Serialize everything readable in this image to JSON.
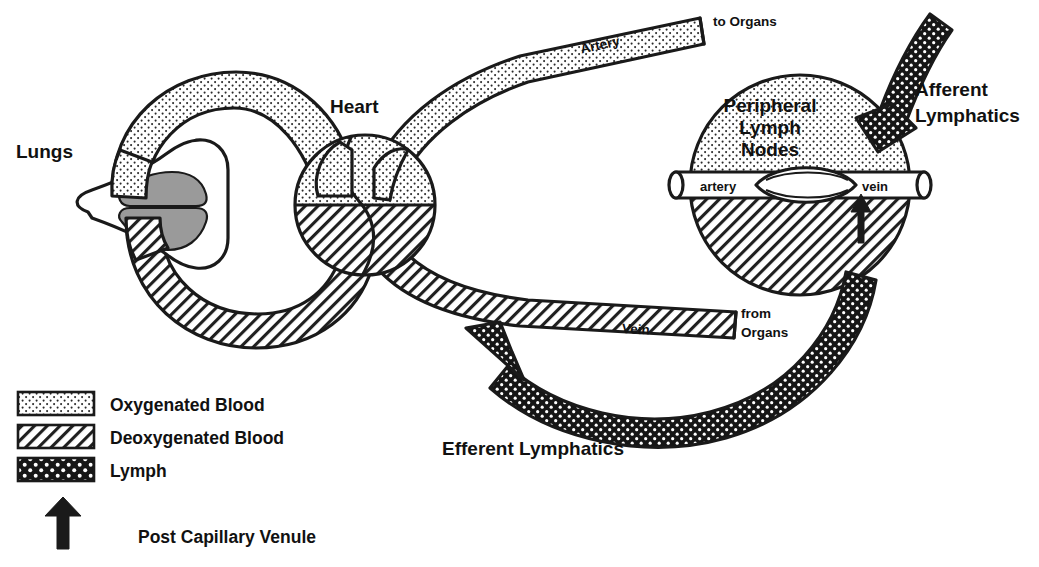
{
  "figure": {
    "type": "diagram",
    "background": "#ffffff",
    "ink_color": "#1a1a1a",
    "lung_lobe_color": "#9a9a9a"
  },
  "labels": {
    "lungs": "Lungs",
    "heart": "Heart",
    "artery": "Artery",
    "vein": "Vein",
    "to_organs": "to Organs",
    "from_organs_line1": "from",
    "from_organs_line2": "Organs",
    "peripheral_line1": "Peripheral",
    "peripheral_line2": "Lymph",
    "peripheral_line3": "Nodes",
    "node_artery": "artery",
    "node_vein": "vein",
    "afferent_line1": "Afferent",
    "afferent_line2": "Lymphatics",
    "efferent": "Efferent Lymphatics"
  },
  "legend": {
    "items": [
      {
        "label": "Oxygenated Blood",
        "swatch": "stipple-light",
        "icon": "swatch-oxygenated"
      },
      {
        "label": "Deoxygenated Blood",
        "swatch": "hatch-diagonal",
        "icon": "swatch-deoxygenated"
      },
      {
        "label": "Lymph",
        "swatch": "dark-dotted",
        "icon": "swatch-lymph"
      }
    ],
    "arrow_item": {
      "label": "Post Capillary Venule",
      "icon": "up-arrow-icon"
    }
  }
}
